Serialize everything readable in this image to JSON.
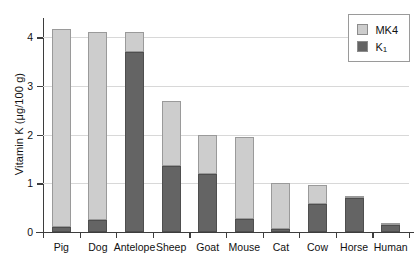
{
  "chart_data": {
    "type": "bar",
    "subtype": "stacked-bar",
    "title": "",
    "xlabel": "",
    "ylabel": "Vitamin K (μg/100 g)",
    "ylim": [
      0,
      4.4
    ],
    "yticks": [
      0,
      1,
      2,
      3,
      4
    ],
    "ytick_labels": [
      "0",
      "1",
      "2",
      "3",
      "4"
    ],
    "grid": "horizontal",
    "legend_position": "top-right",
    "categories": [
      "Pig",
      "Dog",
      "Antelope",
      "Sheep",
      "Goat",
      "Mouse",
      "Cat",
      "Cow",
      "Horse",
      "Human"
    ],
    "series": [
      {
        "name": "K1",
        "label_html": "K<sub>1</sub>",
        "color": "#646464",
        "values": [
          0.1,
          0.25,
          3.7,
          1.35,
          1.2,
          0.26,
          0.07,
          0.58,
          0.7,
          0.15
        ]
      },
      {
        "name": "MK4",
        "label_html": "MK4",
        "color": "#cdcdcd",
        "values": [
          4.08,
          3.87,
          0.41,
          1.35,
          0.8,
          1.7,
          0.93,
          0.39,
          0.02,
          0.04
        ]
      }
    ],
    "totals": [
      4.18,
      4.12,
      4.11,
      2.7,
      2.0,
      1.96,
      1.0,
      0.97,
      0.72,
      0.19
    ]
  },
  "legend": {
    "entries": [
      {
        "label": "MK4",
        "color": "#cdcdcd"
      },
      {
        "label": "K1",
        "color": "#646464"
      }
    ]
  },
  "colors": {
    "mk4": "#cdcdcd",
    "k1": "#646464",
    "axis": "#3d3d3d",
    "grid": "#d8d8d8",
    "background": "#ffffff"
  }
}
